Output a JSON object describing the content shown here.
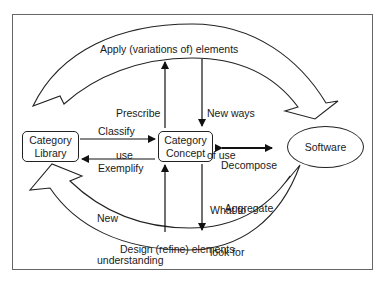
{
  "diagram": {
    "nodes": {
      "category_library": {
        "line1": "Category",
        "line2": "Library"
      },
      "category_concept": {
        "line1": "Category",
        "line2": "Concept"
      },
      "software": {
        "label": "Software"
      }
    },
    "arcs": {
      "top": "Apply (variations of) elements",
      "bottom": "Design (refine) elements"
    },
    "edges": {
      "classify": "Classify",
      "exemplify": "Exemplify",
      "prescribe_use_1": "Prescribe",
      "prescribe_use_2": "use",
      "new_ways_1": "New ways",
      "new_ways_2": "of use",
      "decompose": "Decompose",
      "aggregate": "Aggregate",
      "new_understanding_1": "New",
      "new_understanding_2": "understanding",
      "what_to_look_1": "What to",
      "what_to_look_2": "look for"
    }
  }
}
